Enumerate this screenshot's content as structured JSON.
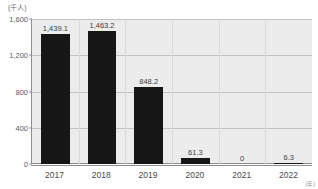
{
  "chart_data": {
    "type": "bar",
    "title": "",
    "subtitle": "",
    "xlabel": "(年)",
    "ylabel": "(千人)",
    "categories": [
      "2017",
      "2018",
      "2019",
      "2020",
      "2021",
      "2022"
    ],
    "values": [
      1439.1,
      1463.2,
      848.2,
      61.3,
      0,
      6.3
    ],
    "value_labels": [
      "1,439.1",
      "1,463.2",
      "848.2",
      "61.3",
      "0",
      "6.3"
    ],
    "ylim": [
      0,
      1600
    ],
    "yticks": [
      0,
      400,
      800,
      1200,
      1600
    ],
    "ytick_labels": [
      "0",
      "400",
      "800",
      "1,200",
      "1,600"
    ],
    "grid": true,
    "legend": false,
    "legend_position": "none",
    "series": [
      {
        "name": "",
        "values": [
          1439.1,
          1463.2,
          848.2,
          61.3,
          0,
          6.3
        ],
        "color": "#161616"
      }
    ]
  },
  "axis": {
    "unit_top": "(千人)",
    "unit_bottom": "(年)"
  },
  "colors": {
    "bar": "#161616",
    "plot_background": "#ececed",
    "gridline": "#c2c2c2",
    "axis_line": "#8e8e8e",
    "page_background": "#ffffff",
    "text": "#4a4a4a"
  }
}
